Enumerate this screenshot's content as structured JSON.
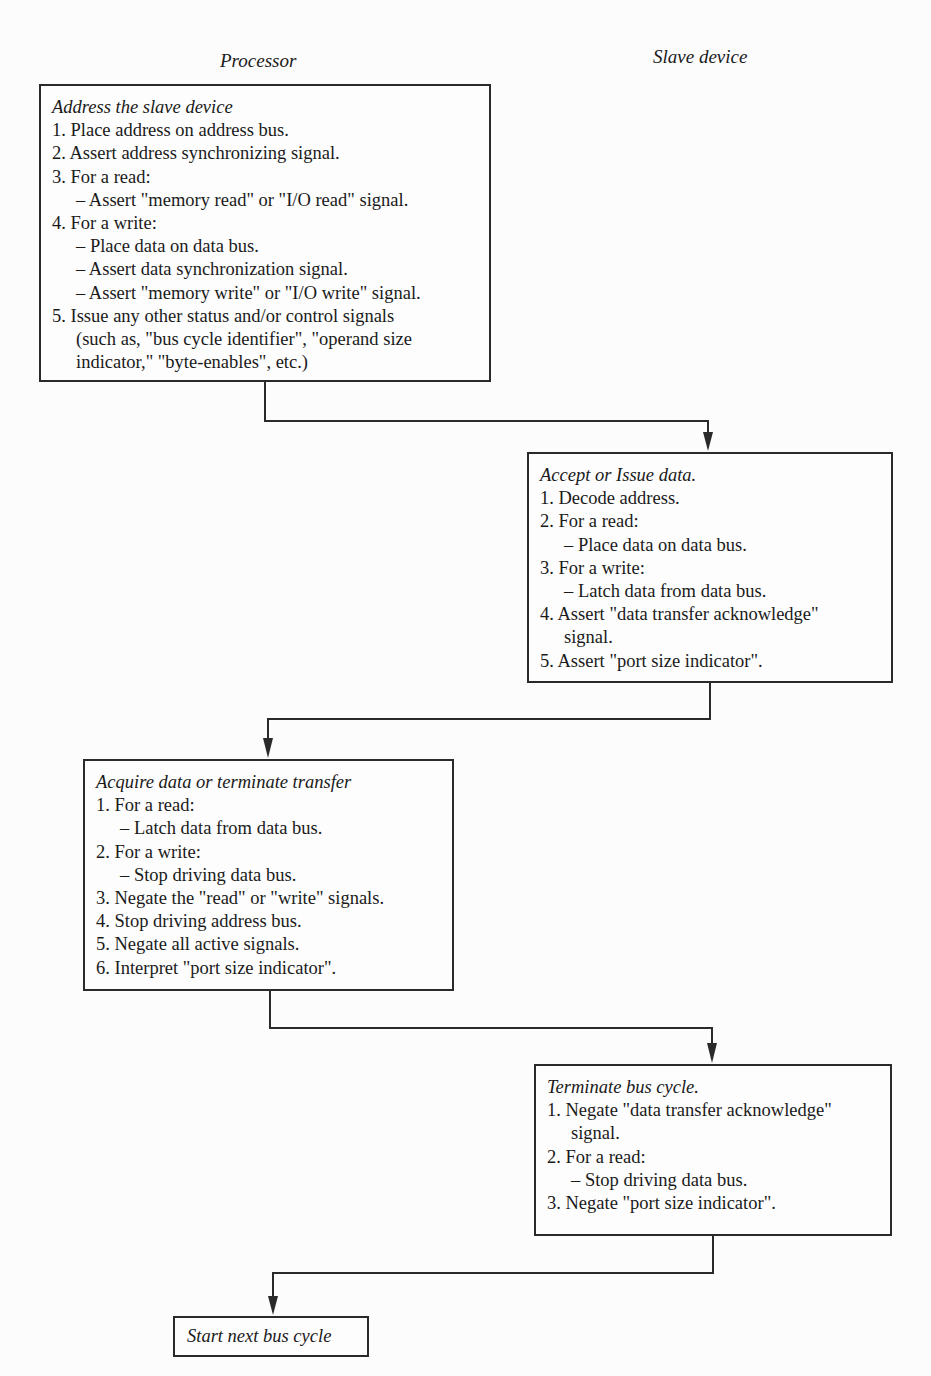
{
  "headers": {
    "processor": "Processor",
    "slave": "Slave device"
  },
  "steps": [
    {
      "id": "address-slave",
      "column": "processor",
      "title": "Address the slave device",
      "lines": [
        {
          "text": "1. Place address on address bus.",
          "indent": 1
        },
        {
          "text": "2. Assert address synchronizing signal.",
          "indent": 1
        },
        {
          "text": "3. For a read:",
          "indent": 1
        },
        {
          "text": "– Assert \"memory read\" or \"I/O read\" signal.",
          "indent": 2
        },
        {
          "text": "4. For a write:",
          "indent": 1
        },
        {
          "text": "– Place data on data bus.",
          "indent": 2
        },
        {
          "text": "– Assert data synchronization signal.",
          "indent": 2
        },
        {
          "text": "– Assert \"memory write\" or \"I/O write\" signal.",
          "indent": 2
        },
        {
          "text": "5. Issue any other status and/or control signals",
          "indent": 1
        },
        {
          "text": "(such as, \"bus cycle identifier\", \"operand size",
          "indent": 3
        },
        {
          "text": "indicator,\" \"byte-enables\", etc.)",
          "indent": 3
        }
      ]
    },
    {
      "id": "accept-issue-data",
      "column": "slave",
      "title": "Accept or Issue data.",
      "lines": [
        {
          "text": "1. Decode address.",
          "indent": 1
        },
        {
          "text": "2. For a read:",
          "indent": 1
        },
        {
          "text": "– Place data on data bus.",
          "indent": 2
        },
        {
          "text": "3. For a write:",
          "indent": 1
        },
        {
          "text": "– Latch data from data bus.",
          "indent": 2
        },
        {
          "text": "4. Assert \"data transfer acknowledge\"",
          "indent": 1
        },
        {
          "text": "signal.",
          "indent": 3
        },
        {
          "text": "5. Assert \"port size indicator\".",
          "indent": 1
        }
      ]
    },
    {
      "id": "acquire-terminate",
      "column": "processor",
      "title": "Acquire data or terminate transfer",
      "lines": [
        {
          "text": "1. For a read:",
          "indent": 1
        },
        {
          "text": "– Latch data from data bus.",
          "indent": 2
        },
        {
          "text": "2. For a write:",
          "indent": 1
        },
        {
          "text": "– Stop driving data bus.",
          "indent": 2
        },
        {
          "text": "3. Negate the \"read\" or \"write\" signals.",
          "indent": 1
        },
        {
          "text": "4. Stop driving address bus.",
          "indent": 1
        },
        {
          "text": "5. Negate all active signals.",
          "indent": 1
        },
        {
          "text": "6. Interpret \"port size indicator\".",
          "indent": 1
        }
      ]
    },
    {
      "id": "terminate-bus-cycle",
      "column": "slave",
      "title": "Terminate bus cycle.",
      "lines": [
        {
          "text": "1. Negate \"data transfer acknowledge\"",
          "indent": 1
        },
        {
          "text": "signal.",
          "indent": 3
        },
        {
          "text": "2. For a read:",
          "indent": 1
        },
        {
          "text": "– Stop driving data bus.",
          "indent": 2
        },
        {
          "text": "3. Negate \"port size indicator\".",
          "indent": 1
        }
      ]
    },
    {
      "id": "start-next",
      "column": "processor",
      "title": "Start next bus cycle",
      "lines": []
    }
  ],
  "colors": {
    "line": "#2a2a2a",
    "background": "#fcfcfc",
    "text": "#1a1a1a"
  }
}
